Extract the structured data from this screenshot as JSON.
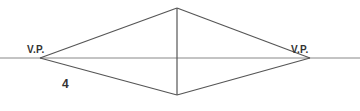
{
  "diagram": {
    "colors": {
      "line": "#555555",
      "horizon": "#888888",
      "text": "#333333",
      "background": "#ffffff"
    },
    "horizon_line": {
      "x1": 0,
      "y1": 58,
      "x2": 360,
      "y2": 58
    },
    "vertical_edge": {
      "x": 177,
      "top": 8,
      "bottom": 95
    },
    "vanishing_points": [
      {
        "id": "left",
        "label": "V.P.",
        "x": 40,
        "y": 58,
        "label_x": 27,
        "label_y": 45
      },
      {
        "id": "right",
        "label": "V.P.",
        "x": 310,
        "y": 58,
        "label_x": 291,
        "label_y": 45
      }
    ],
    "figure_number": {
      "label": "4",
      "x": 62,
      "y": 78
    }
  }
}
